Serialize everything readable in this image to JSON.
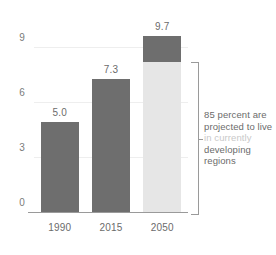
{
  "chart_data": {
    "type": "bar",
    "title": "",
    "subtitle": "",
    "xlabel": "",
    "ylabel": "",
    "categories": [
      "1990",
      "2015",
      "2050"
    ],
    "values": [
      5.0,
      7.3,
      9.7
    ],
    "value_labels": [
      "5.0",
      "7.3",
      "9.7"
    ],
    "ylim": [
      0,
      10
    ],
    "yticks": [
      "0",
      "3",
      "6",
      "9"
    ],
    "ytick_values": [
      0,
      3,
      6,
      9
    ],
    "grid": true,
    "legend": "none",
    "series": [
      {
        "name": "currently developing regions",
        "values": [
          null,
          null,
          8.25
        ],
        "color": "#e6e6e6"
      },
      {
        "name": "other regions",
        "values": [
          5.0,
          7.3,
          1.45
        ],
        "color": "#6e6e6e"
      }
    ],
    "bars": [
      {
        "category": "1990",
        "total": 5.0,
        "label": "5.0",
        "segments": [
          {
            "part": "dark",
            "value": 5.0,
            "color": "#6e6e6e"
          }
        ]
      },
      {
        "category": "2015",
        "total": 7.3,
        "label": "7.3",
        "segments": [
          {
            "part": "dark",
            "value": 7.3,
            "color": "#6e6e6e"
          }
        ]
      },
      {
        "category": "2050",
        "total": 9.7,
        "label": "9.7",
        "segments": [
          {
            "part": "dark",
            "value": 1.45,
            "color": "#6e6e6e"
          },
          {
            "part": "light",
            "value": 8.25,
            "color": "#e6e6e6"
          }
        ]
      }
    ],
    "annotations": [
      {
        "target_category": "2050",
        "target_segment": "light",
        "lines": [
          "85 percent are",
          "projected to live",
          "in currently",
          "developing",
          "regions"
        ],
        "text": "85 percent are projected to live in currently developing regions",
        "percent": "85"
      }
    ]
  },
  "colors": {
    "bar_dark": "#6e6e6e",
    "bar_light": "#e6e6e6",
    "gridline": "#eeeeee",
    "axis": "#9a9a9a",
    "text": "#6b6b6b",
    "background": "#ffffff"
  }
}
